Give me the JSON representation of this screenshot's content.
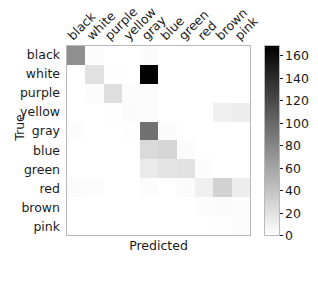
{
  "figure": {
    "xlabel": "Predicted",
    "ylabel": "True",
    "caption": ""
  },
  "colorbar": {
    "ticks": [
      "0",
      "20",
      "40",
      "60",
      "80",
      "100",
      "120",
      "140",
      "160"
    ],
    "tick_values": [
      0,
      20,
      40,
      60,
      80,
      100,
      120,
      140,
      160
    ],
    "vmin": 0,
    "vmax": 170,
    "colormap": "Greys",
    "high_color": "#000000",
    "low_color": "#ffffff"
  },
  "chart_data": {
    "type": "heatmap",
    "title": "",
    "xlabel": "Predicted",
    "ylabel": "True",
    "categories": [
      "black",
      "white",
      "purple",
      "yellow",
      "gray",
      "blue",
      "green",
      "red",
      "brown",
      "pink"
    ],
    "x": [
      "black",
      "white",
      "purple",
      "yellow",
      "gray",
      "blue",
      "green",
      "red",
      "brown",
      "pink"
    ],
    "y": [
      "black",
      "white",
      "purple",
      "yellow",
      "gray",
      "blue",
      "green",
      "red",
      "brown",
      "pink"
    ],
    "zlim": [
      0,
      170
    ],
    "grid": false,
    "legend_position": "right",
    "colormap": "Greys",
    "values": [
      [
        75,
        2,
        0,
        0,
        3,
        0,
        0,
        0,
        0,
        0
      ],
      [
        0,
        20,
        1,
        0,
        168,
        0,
        0,
        0,
        0,
        0
      ],
      [
        0,
        2,
        22,
        2,
        2,
        0,
        0,
        0,
        0,
        0
      ],
      [
        0,
        0,
        1,
        3,
        2,
        0,
        0,
        0,
        10,
        12
      ],
      [
        2,
        0,
        0,
        1,
        95,
        3,
        0,
        0,
        0,
        0
      ],
      [
        0,
        0,
        0,
        0,
        25,
        28,
        3,
        0,
        0,
        0
      ],
      [
        0,
        0,
        0,
        0,
        14,
        18,
        20,
        2,
        0,
        0
      ],
      [
        3,
        2,
        0,
        0,
        2,
        0,
        3,
        10,
        30,
        12
      ],
      [
        0,
        0,
        0,
        0,
        0,
        0,
        0,
        2,
        3,
        2
      ],
      [
        0,
        0,
        0,
        0,
        0,
        0,
        0,
        0,
        1,
        2
      ]
    ]
  }
}
